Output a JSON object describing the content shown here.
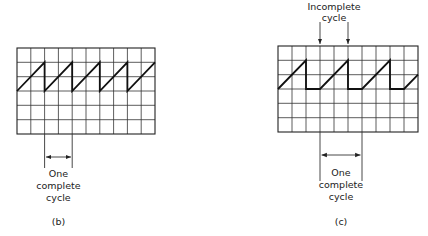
{
  "panels": [
    {
      "id": "b",
      "caption": "(b)",
      "grid": {
        "cols": 10,
        "rows": 6
      },
      "waveform": "sawtooth, continuous, rising over 2 divisions then vertical drop",
      "annotation": {
        "line1": "One",
        "line2": "complete",
        "line3": "cycle"
      }
    },
    {
      "id": "c",
      "caption": "(c)",
      "grid": {
        "cols": 10,
        "rows": 6
      },
      "waveform": "sawtooth with flat segment: rising over 2 divisions, vertical drop, flat 1 division",
      "top_annotation": {
        "line1": "Incomplete",
        "line2": "cycle"
      },
      "annotation": {
        "line1": "One",
        "line2": "complete",
        "line3": "cycle"
      }
    }
  ]
}
